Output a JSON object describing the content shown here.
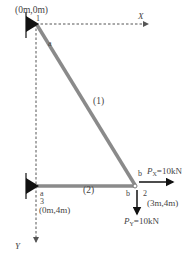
{
  "diagram": {
    "type": "truss",
    "nodes": [
      {
        "id": "1",
        "coord_label": "(0m,0m)",
        "support": "pin"
      },
      {
        "id": "2",
        "coord_label": "(3m,4m)",
        "support": "none"
      },
      {
        "id": "3",
        "coord_label": "(0m,4m)",
        "support": "pin"
      }
    ],
    "members": [
      {
        "id": "(1)",
        "from": "1",
        "to": "2",
        "end_a": "a",
        "end_b": "b"
      },
      {
        "id": "(2)",
        "from": "3",
        "to": "2",
        "end_a": "a",
        "end_b": "b"
      }
    ],
    "axes": {
      "x_label": "X",
      "y_label": "Y"
    },
    "loads": {
      "px": {
        "symbol": "P",
        "subscript": "X",
        "value": "=10kN"
      },
      "py": {
        "symbol": "P",
        "subscript": "Y",
        "value": "=10kN"
      }
    },
    "colors": {
      "member": "#8a8a8a",
      "support": "#111111",
      "axis": "#555555",
      "load": "#111111"
    }
  }
}
